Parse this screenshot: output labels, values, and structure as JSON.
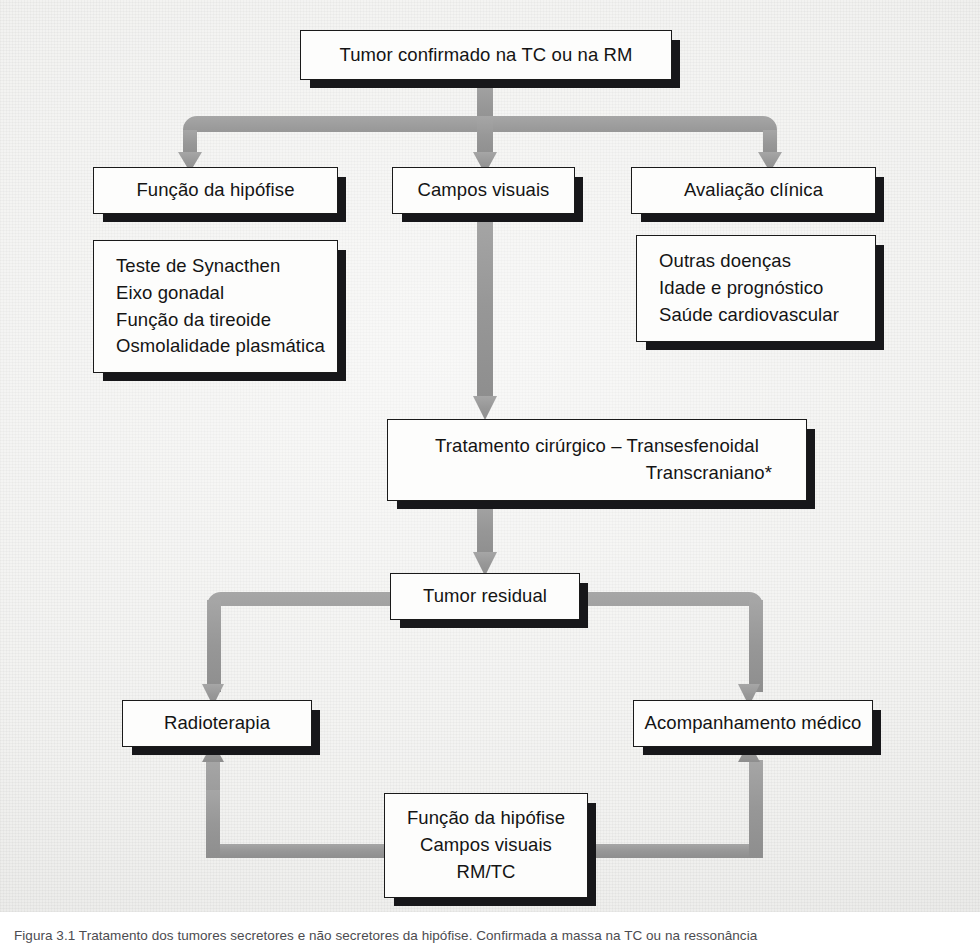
{
  "figure": {
    "kind": "clinical-flowchart",
    "language": "pt-BR",
    "background_color": "#f1f1ef",
    "connector_color": "#9a9a9a",
    "box_fill": "#fdfdfc",
    "box_border": "#1a1a1a",
    "shadow_color": "#17171a"
  },
  "nodes": {
    "tumor_confirmed": {
      "label": "Tumor confirmado na TC ou na RM"
    },
    "pituitary_function": {
      "label": "Função da hipófise"
    },
    "visual_fields": {
      "label": "Campos visuais"
    },
    "clinical_evaluation": {
      "label": "Avaliação clínica"
    },
    "pituitary_tests": {
      "lines": [
        "Teste de Synacthen",
        "Eixo gonadal",
        "Função da tireoide",
        "Osmolalidade plasmática"
      ]
    },
    "clinical_factors": {
      "lines": [
        "Outras doenças",
        "Idade e prognóstico",
        "Saúde cardiovascular"
      ]
    },
    "surgical_treatment": {
      "line1": "Tratamento cirúrgico – Transesfenoidal",
      "line2": "Transcraniano*"
    },
    "residual_tumor": {
      "label": "Tumor residual"
    },
    "radiotherapy": {
      "label": "Radioterapia"
    },
    "medical_followup": {
      "label": "Acompanhamento médico"
    },
    "followup_monitoring": {
      "lines": [
        "Função da hipófise",
        "Campos visuais",
        "RM/TC"
      ]
    }
  },
  "caption": {
    "text": "Figura 3.1 Tratamento dos tumores secretores e não secretores da hipófise. Confirmada a massa na TC ou na ressonância"
  }
}
